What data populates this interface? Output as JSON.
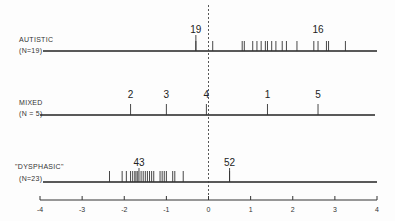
{
  "chart_data": {
    "type": "scatter",
    "subtype": "strip / rug plot",
    "title": "",
    "xlabel": "",
    "ylabel": "",
    "xlim": [
      -4,
      4
    ],
    "x_ticks": [
      -4,
      -3,
      -2,
      -1,
      0,
      1,
      2,
      3,
      4
    ],
    "x_tick_labels": [
      "-4",
      "-3",
      "-2",
      "-1",
      "0",
      "1",
      "2",
      "3",
      "4"
    ],
    "reference_line": {
      "x": 0,
      "style": "dashed vertical"
    },
    "grid": false,
    "legend": null,
    "series": [
      {
        "name": "AUTISTIC",
        "n_label": "(N=19)",
        "values": [
          -0.3,
          0.1,
          0.8,
          0.85,
          1.05,
          1.15,
          1.25,
          1.35,
          1.4,
          1.5,
          1.6,
          1.75,
          1.85,
          2.1,
          2.5,
          2.6,
          2.8,
          2.85,
          3.25
        ],
        "annotations": [
          {
            "label": "19",
            "x": -0.3
          },
          {
            "label": "16",
            "x": 2.6
          }
        ]
      },
      {
        "name": "MIXED",
        "n_label": "(N = 5)",
        "values": [
          -1.85,
          -1.0,
          -0.05,
          1.4,
          2.6
        ],
        "annotations": [
          {
            "label": "2",
            "x": -1.85
          },
          {
            "label": "3",
            "x": -1.0
          },
          {
            "label": "4",
            "x": -0.05
          },
          {
            "label": "1",
            "x": 1.4
          },
          {
            "label": "5",
            "x": 2.6
          }
        ]
      },
      {
        "name": "\"DYSPHASIC\"",
        "n_label": "(N=23)",
        "values": [
          -2.35,
          -2.05,
          -1.95,
          -1.85,
          -1.8,
          -1.75,
          -1.72,
          -1.68,
          -1.6,
          -1.55,
          -1.5,
          -1.45,
          -1.4,
          -1.35,
          -1.3,
          -1.15,
          -1.1,
          -1.05,
          -1.0,
          -0.85,
          -0.8,
          -0.6,
          0.5
        ],
        "annotations": [
          {
            "label": "43",
            "x": -1.65
          },
          {
            "label": "52",
            "x": 0.5
          }
        ]
      }
    ]
  },
  "labels": {
    "autistic": {
      "name": "AUTISTIC",
      "n": "(N=19)"
    },
    "mixed": {
      "name": "MIXED",
      "n": "(N = 5)"
    },
    "dysphasic": {
      "name": "\"DYSPHASIC\"",
      "n": "(N=23)"
    }
  }
}
